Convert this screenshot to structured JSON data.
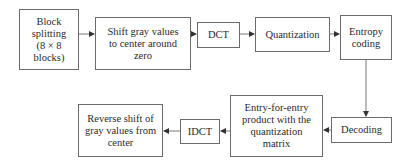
{
  "diagram": {
    "title": "",
    "nodes": [
      {
        "id": "block_splitting",
        "label": "Block\nsplitting\n(8 × 8\nblocks)"
      },
      {
        "id": "shift",
        "label": "Shift gray values\nto center around\nzero"
      },
      {
        "id": "dct",
        "label": "DCT"
      },
      {
        "id": "quantization",
        "label": "Quantization"
      },
      {
        "id": "entropy_coding",
        "label": "Entropy\ncoding"
      },
      {
        "id": "decoding",
        "label": "Decoding"
      },
      {
        "id": "entry_product",
        "label": "Entry-for-entry\nproduct with the\nquantization\nmatrix"
      },
      {
        "id": "idct",
        "label": "IDCT"
      },
      {
        "id": "reverse_shift",
        "label": "Reverse shift of\ngray values from\ncenter"
      }
    ],
    "edges": [
      {
        "from": "block_splitting",
        "to": "shift"
      },
      {
        "from": "shift",
        "to": "dct"
      },
      {
        "from": "dct",
        "to": "quantization"
      },
      {
        "from": "quantization",
        "to": "entropy_coding"
      },
      {
        "from": "entropy_coding",
        "to": "decoding"
      },
      {
        "from": "decoding",
        "to": "entry_product"
      },
      {
        "from": "entry_product",
        "to": "idct"
      },
      {
        "from": "idct",
        "to": "reverse_shift"
      }
    ],
    "colors": {
      "stroke": "#6b6b6b",
      "arrow": "#333333",
      "text": "#2a2a2a"
    }
  }
}
